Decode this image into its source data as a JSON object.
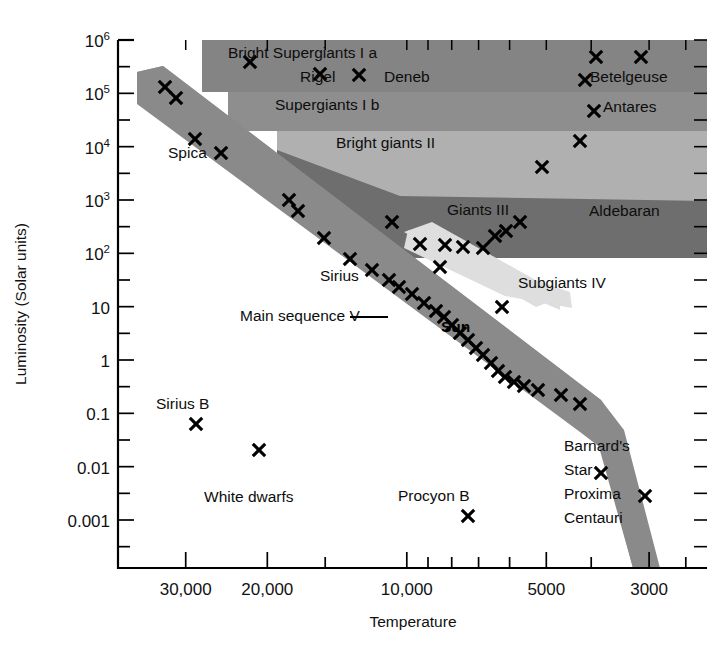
{
  "figure": {
    "kind": "hertzsprung-russell-diagram",
    "background": "#ffffff"
  },
  "chart_data": {
    "type": "scatter",
    "title": "",
    "xlabel": "Temperature",
    "ylabel": "Luminosity (Solar units)",
    "x_scale": "log-reversed",
    "y_scale": "log",
    "xlim": [
      40000,
      2200
    ],
    "ylim": [
      0.0002,
      1000000
    ],
    "grid": false,
    "legend": "none",
    "x_ticklabels": [
      "30,000",
      "20,000",
      "10,000",
      "5000",
      "3000"
    ],
    "x_tickvalues": [
      30000,
      20000,
      10000,
      5000,
      3000
    ],
    "y_ticklabels": [
      "10^6",
      "10^5",
      "10^4",
      "10^3",
      "10^2",
      "10",
      "1",
      "0.1",
      "0.01",
      "0.001"
    ],
    "y_tickvalues": [
      1000000,
      100000,
      10000,
      1000,
      100,
      10,
      1,
      0.1,
      0.01,
      0.001
    ],
    "y_tick_bases": [
      "10",
      "10",
      "10",
      "10",
      "10",
      "10",
      "1",
      "0.1",
      "0.01",
      "0.001"
    ],
    "y_tick_exponents": [
      "6",
      "5",
      "4",
      "3",
      "2",
      "",
      "",
      "",
      "",
      ""
    ],
    "annotations": [
      {
        "name": "bright-supergiants-ia",
        "text": "Bright Supergiants I a",
        "x": 228,
        "y": 58
      },
      {
        "name": "rigel",
        "text": "Rigel",
        "x": 300,
        "y": 82
      },
      {
        "name": "deneb",
        "text": "Deneb",
        "x": 384,
        "y": 82
      },
      {
        "name": "betelgeuse",
        "text": "Betelgeuse",
        "x": 590,
        "y": 82
      },
      {
        "name": "supergiants-ib",
        "text": "Supergiants I b",
        "x": 275,
        "y": 110
      },
      {
        "name": "antares",
        "text": "Antares",
        "x": 603,
        "y": 112
      },
      {
        "name": "bright-giants-ii",
        "text": "Bright giants II",
        "x": 336,
        "y": 148
      },
      {
        "name": "giants-iii",
        "text": "Giants III",
        "x": 447,
        "y": 215
      },
      {
        "name": "aldebaran",
        "text": "Aldebaran",
        "x": 589,
        "y": 216
      },
      {
        "name": "subgiants-iv",
        "text": "Subgiants IV",
        "x": 518,
        "y": 288
      },
      {
        "name": "spica",
        "text": "Spica",
        "x": 168,
        "y": 158
      },
      {
        "name": "sirius",
        "text": "Sirius",
        "x": 320,
        "y": 281
      },
      {
        "name": "main-sequence-v",
        "text": "Main sequence V",
        "x": 240,
        "y": 321
      },
      {
        "name": "sun",
        "text": "Sun",
        "x": 441,
        "y": 332
      },
      {
        "name": "sirius-b",
        "text": "Sirius B",
        "x": 156,
        "y": 409
      },
      {
        "name": "white-dwarfs",
        "text": "White dwarfs",
        "x": 204,
        "y": 502
      },
      {
        "name": "procyon-b",
        "text": "Procyon B",
        "x": 398,
        "y": 501
      },
      {
        "name": "barnards",
        "text": "Barnard's",
        "x": 564,
        "y": 451
      },
      {
        "name": "star",
        "text": "Star",
        "x": 564,
        "y": 475
      },
      {
        "name": "proxima",
        "text": "Proxima",
        "x": 564,
        "y": 499
      },
      {
        "name": "centauri",
        "text": "Centauri",
        "x": 564,
        "y": 523
      }
    ],
    "regions": [
      {
        "name": "bright-supergiants-ia",
        "label": "Bright Supergiants I a",
        "color": "#828282"
      },
      {
        "name": "supergiants-ib",
        "label": "Supergiants I b",
        "color": "#8d8d8d"
      },
      {
        "name": "bright-giants-ii",
        "label": "Bright giants II",
        "color": "#adadad"
      },
      {
        "name": "giants-iii",
        "label": "Giants III",
        "color": "#6f6f6f"
      },
      {
        "name": "subgiants-iv",
        "label": "Subgiants IV",
        "color": "#dcdcdc"
      },
      {
        "name": "main-sequence-v",
        "label": "Main sequence V",
        "color": "#8a8a8a"
      }
    ],
    "points": [
      {
        "px": 165,
        "py": 87
      },
      {
        "px": 176,
        "py": 98
      },
      {
        "px": 195,
        "py": 139
      },
      {
        "px": 221,
        "py": 153
      },
      {
        "px": 250,
        "py": 62
      },
      {
        "px": 289,
        "py": 200
      },
      {
        "px": 298,
        "py": 211
      },
      {
        "px": 320,
        "py": 74
      },
      {
        "px": 324,
        "py": 238
      },
      {
        "px": 359,
        "py": 75
      },
      {
        "px": 350,
        "py": 259
      },
      {
        "px": 372,
        "py": 270
      },
      {
        "px": 389,
        "py": 280
      },
      {
        "px": 399,
        "py": 287
      },
      {
        "px": 412,
        "py": 294
      },
      {
        "px": 424,
        "py": 303
      },
      {
        "px": 436,
        "py": 311
      },
      {
        "px": 444,
        "py": 317
      },
      {
        "px": 452,
        "py": 325
      },
      {
        "px": 460,
        "py": 333
      },
      {
        "px": 468,
        "py": 340
      },
      {
        "px": 476,
        "py": 348
      },
      {
        "px": 483,
        "py": 355
      },
      {
        "px": 491,
        "py": 363
      },
      {
        "px": 498,
        "py": 371
      },
      {
        "px": 505,
        "py": 377
      },
      {
        "px": 514,
        "py": 382
      },
      {
        "px": 524,
        "py": 386
      },
      {
        "px": 538,
        "py": 390
      },
      {
        "px": 561,
        "py": 395
      },
      {
        "px": 580,
        "py": 404
      },
      {
        "px": 420,
        "py": 244
      },
      {
        "px": 445,
        "py": 245
      },
      {
        "px": 463,
        "py": 247
      },
      {
        "px": 483,
        "py": 248
      },
      {
        "px": 495,
        "py": 236
      },
      {
        "px": 506,
        "py": 231
      },
      {
        "px": 520,
        "py": 222
      },
      {
        "px": 440,
        "py": 267
      },
      {
        "px": 502,
        "py": 307
      },
      {
        "px": 392,
        "py": 222
      },
      {
        "px": 542,
        "py": 167
      },
      {
        "px": 580,
        "py": 141
      },
      {
        "px": 596,
        "py": 57
      },
      {
        "px": 641,
        "py": 57
      },
      {
        "px": 585,
        "py": 80
      },
      {
        "px": 594,
        "py": 111
      },
      {
        "px": 196,
        "py": 424
      },
      {
        "px": 259,
        "py": 450
      },
      {
        "px": 468,
        "py": 516
      },
      {
        "px": 601,
        "py": 473
      },
      {
        "px": 645,
        "py": 496
      }
    ]
  },
  "axes": {
    "x_title": "Temperature",
    "y_title": "Luminosity (Solar units)"
  }
}
